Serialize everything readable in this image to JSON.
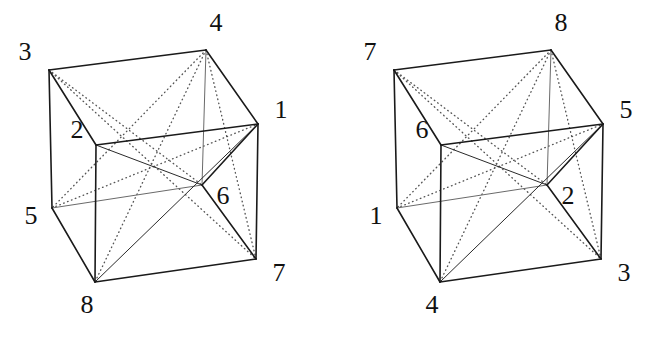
{
  "figure": {
    "background_color": "#ffffff",
    "edge_color": "#1a1a1a",
    "hidden_edge_color": "#6a6a6a",
    "diagonal_solid_color": "#2a2a2a",
    "diagonal_dotted_color": "#555555",
    "label_color": "#111111",
    "width": 648,
    "height": 337
  },
  "geometry": {
    "note": "Shared cube wireframe shape; each cube instance is this shape translated by its origin offset.",
    "corner_points": {
      "top_back_left": {
        "x": 49,
        "y": 70
      },
      "top_back_right": {
        "x": 206,
        "y": 50
      },
      "top_front_left": {
        "x": 96,
        "y": 145
      },
      "top_front_right": {
        "x": 258,
        "y": 124
      },
      "bottom_back_left": {
        "x": 52,
        "y": 208
      },
      "bottom_back_right": {
        "x": 202,
        "y": 185
      },
      "bottom_front_left": {
        "x": 95,
        "y": 282
      },
      "bottom_front_right": {
        "x": 256,
        "y": 259
      }
    },
    "visible_edges": [
      [
        "top_back_left",
        "top_back_right"
      ],
      [
        "top_back_right",
        "top_front_right"
      ],
      [
        "top_front_right",
        "top_front_left"
      ],
      [
        "top_front_left",
        "top_back_left"
      ],
      [
        "top_back_left",
        "bottom_back_left"
      ],
      [
        "top_front_left",
        "bottom_front_left"
      ],
      [
        "top_front_right",
        "bottom_front_right"
      ],
      [
        "bottom_back_left",
        "bottom_front_left"
      ],
      [
        "bottom_front_left",
        "bottom_front_right"
      ],
      [
        "bottom_front_right",
        "bottom_back_right"
      ],
      [
        "bottom_back_right",
        "top_front_right"
      ]
    ],
    "hidden_edges": [
      [
        "bottom_back_left",
        "bottom_back_right"
      ],
      [
        "top_back_right",
        "bottom_back_right"
      ]
    ],
    "solid_diagonals": [
      [
        "top_front_left",
        "bottom_back_right"
      ],
      [
        "bottom_front_left",
        "top_front_right"
      ]
    ],
    "dotted_diagonals": [
      [
        "top_back_left",
        "bottom_front_right"
      ],
      [
        "top_back_right",
        "bottom_front_left"
      ],
      [
        "top_back_left",
        "bottom_back_right"
      ],
      [
        "top_back_right",
        "bottom_back_left"
      ],
      [
        "bottom_back_left",
        "top_front_right"
      ],
      [
        "top_back_right",
        "bottom_front_right"
      ]
    ]
  },
  "cubes": [
    {
      "id": "cube-left",
      "name": "left-cube",
      "origin": {
        "x": 0,
        "y": 0
      },
      "labels": [
        {
          "corner": "top_back_left",
          "text": "3",
          "dx": -24,
          "dy": -16
        },
        {
          "corner": "top_back_right",
          "text": "4",
          "dx": 10,
          "dy": -25
        },
        {
          "corner": "top_front_left",
          "text": "2",
          "dx": -19,
          "dy": -13
        },
        {
          "corner": "top_front_right",
          "text": "1",
          "dx": 23,
          "dy": -12
        },
        {
          "corner": "bottom_back_left",
          "text": "5",
          "dx": -21,
          "dy": 10
        },
        {
          "corner": "bottom_back_right",
          "text": "6",
          "dx": 21,
          "dy": 13
        },
        {
          "corner": "bottom_front_left",
          "text": "8",
          "dx": -8,
          "dy": 25
        },
        {
          "corner": "bottom_front_right",
          "text": "7",
          "dx": 23,
          "dy": 16
        }
      ]
    },
    {
      "id": "cube-right",
      "name": "right-cube",
      "origin": {
        "x": 345,
        "y": 0
      },
      "labels": [
        {
          "corner": "top_back_left",
          "text": "7",
          "dx": -24,
          "dy": -16
        },
        {
          "corner": "top_back_right",
          "text": "8",
          "dx": 10,
          "dy": -25
        },
        {
          "corner": "top_front_left",
          "text": "6",
          "dx": -19,
          "dy": -13
        },
        {
          "corner": "top_front_right",
          "text": "5",
          "dx": 23,
          "dy": -12
        },
        {
          "corner": "bottom_back_left",
          "text": "1",
          "dx": -21,
          "dy": 10
        },
        {
          "corner": "bottom_back_right",
          "text": "2",
          "dx": 21,
          "dy": 13
        },
        {
          "corner": "bottom_front_left",
          "text": "4",
          "dx": -8,
          "dy": 25
        },
        {
          "corner": "bottom_front_right",
          "text": "3",
          "dx": 23,
          "dy": 16
        }
      ]
    }
  ]
}
